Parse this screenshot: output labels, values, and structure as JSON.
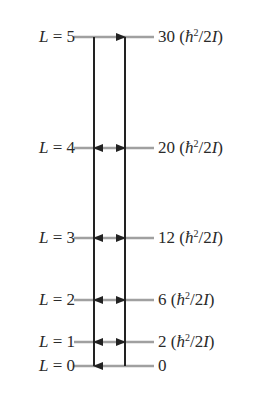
{
  "diagram": {
    "type": "energy-level-diagram",
    "levels": [
      {
        "L": "5",
        "left_prefix": "L",
        "left_eq": " = 5",
        "energy_num": "30",
        "has_unit": true,
        "y": 37
      },
      {
        "L": "4",
        "left_prefix": "L",
        "left_eq": " = 4",
        "energy_num": "20",
        "has_unit": true,
        "y": 148
      },
      {
        "L": "3",
        "left_prefix": "L",
        "left_eq": " = 3",
        "energy_num": "12",
        "has_unit": true,
        "y": 238
      },
      {
        "L": "2",
        "left_prefix": "L",
        "left_eq": " = 2",
        "energy_num": "6",
        "has_unit": true,
        "y": 300
      },
      {
        "L": "1",
        "left_prefix": "L",
        "left_eq": " = 1",
        "energy_num": "2",
        "has_unit": true,
        "y": 342
      },
      {
        "L": "0",
        "left_prefix": "L",
        "left_eq": " = 0",
        "energy_num": "0",
        "has_unit": false,
        "y": 366
      }
    ],
    "unit": {
      "open": " (",
      "hbar": "ħ",
      "exp": "2",
      "mid": "/2",
      "I": "I",
      "close": ")"
    },
    "arrows": {
      "down_x": 94,
      "up_x": 125,
      "down_description": "downward transitions L=5→4→3→2→1→0",
      "up_description": "upward transitions L=0→1→2→3→4→5"
    },
    "colors": {
      "level_line": "#a0a0a0",
      "arrow": "#222222",
      "text": "#2a2a2a"
    }
  }
}
